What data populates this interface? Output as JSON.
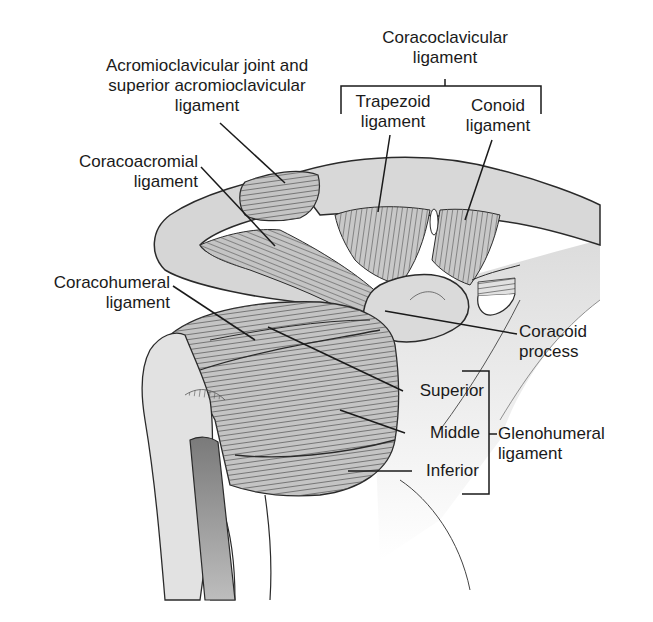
{
  "figure": {
    "labels": {
      "ac_joint": {
        "line1": "Acromioclavicular joint and",
        "line2": "superior acromioclavicular",
        "line3": "ligament"
      },
      "coracoclavicular": {
        "line1": "Coracoclavicular",
        "line2": "ligament"
      },
      "trapezoid": {
        "line1": "Trapezoid",
        "line2": "ligament"
      },
      "conoid": {
        "line1": "Conoid",
        "line2": "ligament"
      },
      "coracoacromial": {
        "line1": "Coracoacromial",
        "line2": "ligament"
      },
      "coracohumeral": {
        "line1": "Coracohumeral",
        "line2": "ligament"
      },
      "coracoid_process": {
        "line1": "Coracoid",
        "line2": "process"
      },
      "superior": "Superior",
      "middle": "Middle",
      "inferior": "Inferior",
      "glenohumeral": {
        "line1": "Glenohumeral",
        "line2": "ligament"
      }
    },
    "colors": {
      "bone": "#d6d6d6",
      "ligament": "#c4c4c4",
      "outline": "#2a2a2a",
      "tendon": "#8e8e8e",
      "text": "#1a1a1a"
    }
  }
}
